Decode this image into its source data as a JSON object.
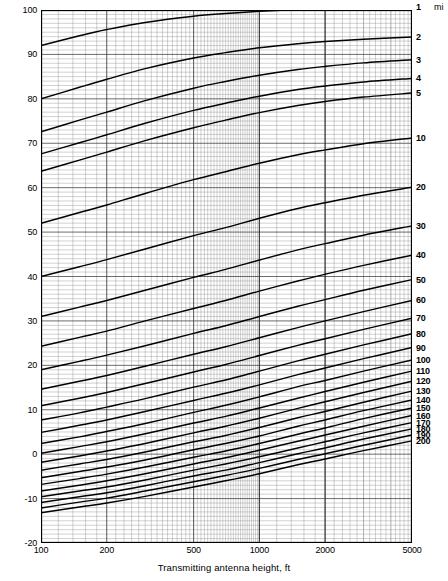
{
  "axes": {
    "x_label": "Transmitting antenna height, ft",
    "y_label": "Field strength F, dB above 1 μ V/m for 1 kW radiated power",
    "right_unit": "mi"
  },
  "chart_data": {
    "type": "line",
    "title": "",
    "xlabel": "Transmitting antenna height, ft",
    "ylabel": "Field strength F, dB above 1 μ V/m for 1 kW radiated power",
    "xscale": "log",
    "yscale": "linear",
    "xlim": [
      100,
      5000
    ],
    "ylim": [
      -20,
      100
    ],
    "grid": true,
    "legend": "right-axis-curve-labels",
    "legend_unit": "mi",
    "x_ticks": [
      100,
      200,
      500,
      1000,
      2000,
      5000
    ],
    "x_tick_labels": [
      "100",
      "200",
      "500",
      "1000",
      "2000",
      "5000"
    ],
    "y_ticks": [
      100,
      90,
      80,
      70,
      60,
      50,
      40,
      30,
      20,
      10,
      0,
      -10,
      -20
    ],
    "y_tick_labels": [
      "100",
      "90",
      "80",
      "70",
      "60",
      "50",
      "40",
      "30",
      "20",
      "10",
      "0",
      "-10",
      "-20"
    ],
    "x": [
      100,
      150,
      200,
      300,
      500,
      700,
      1000,
      1500,
      2000,
      3000,
      5000
    ],
    "series": [
      {
        "name": "1",
        "label": "1",
        "values": [
          92.0,
          94.2,
          95.6,
          97.2,
          98.6,
          99.2,
          99.7,
          100.1,
          100.3,
          100.5,
          100.7
        ]
      },
      {
        "name": "2",
        "label": "2",
        "values": [
          80.0,
          82.6,
          84.4,
          86.8,
          89.2,
          90.4,
          91.5,
          92.4,
          92.9,
          93.4,
          93.9
        ]
      },
      {
        "name": "3",
        "label": "3",
        "values": [
          72.6,
          75.2,
          77.0,
          79.6,
          82.4,
          83.9,
          85.3,
          86.6,
          87.3,
          88.1,
          88.8
        ]
      },
      {
        "name": "4",
        "label": "4",
        "values": [
          67.6,
          70.1,
          71.9,
          74.5,
          77.4,
          79.0,
          80.6,
          82.1,
          82.9,
          83.8,
          84.6
        ]
      },
      {
        "name": "5",
        "label": "5",
        "values": [
          63.7,
          66.2,
          68.0,
          70.6,
          73.5,
          75.2,
          76.9,
          78.5,
          79.4,
          80.4,
          81.3
        ]
      },
      {
        "name": "10",
        "label": "10",
        "values": [
          52.0,
          54.4,
          56.1,
          58.7,
          61.8,
          63.6,
          65.5,
          67.4,
          68.5,
          69.9,
          71.2
        ]
      },
      {
        "name": "20",
        "label": "20",
        "values": [
          40.0,
          42.2,
          43.8,
          46.2,
          49.2,
          51.0,
          53.1,
          55.3,
          56.6,
          58.3,
          60.1
        ]
      },
      {
        "name": "30",
        "label": "30",
        "values": [
          31.0,
          33.1,
          34.6,
          36.9,
          39.8,
          41.6,
          43.7,
          46.0,
          47.4,
          49.3,
          51.4
        ]
      },
      {
        "name": "40",
        "label": "40",
        "values": [
          24.3,
          26.3,
          27.7,
          30.0,
          32.8,
          34.6,
          36.7,
          39.0,
          40.5,
          42.5,
          44.8
        ]
      },
      {
        "name": "50",
        "label": "50",
        "values": [
          19.0,
          20.9,
          22.3,
          24.4,
          27.2,
          28.9,
          31.0,
          33.3,
          34.8,
          36.9,
          39.3
        ]
      },
      {
        "name": "60",
        "label": "60",
        "values": [
          14.6,
          16.4,
          17.7,
          19.8,
          22.5,
          24.2,
          26.2,
          28.5,
          30.0,
          32.1,
          34.6
        ]
      },
      {
        "name": "70",
        "label": "70",
        "values": [
          10.9,
          12.6,
          13.9,
          15.9,
          18.5,
          20.2,
          22.2,
          24.5,
          26.0,
          28.1,
          30.6
        ]
      },
      {
        "name": "80",
        "label": "80",
        "values": [
          7.7,
          9.3,
          10.6,
          12.5,
          15.1,
          16.7,
          18.7,
          21.0,
          22.5,
          24.6,
          27.1
        ]
      },
      {
        "name": "90",
        "label": "90",
        "values": [
          4.9,
          6.5,
          7.7,
          9.6,
          12.1,
          13.7,
          15.6,
          17.9,
          19.4,
          21.5,
          24.0
        ]
      },
      {
        "name": "100",
        "label": "100",
        "values": [
          2.4,
          3.9,
          5.1,
          6.9,
          9.4,
          11.0,
          12.9,
          15.2,
          16.6,
          18.7,
          21.2
        ]
      },
      {
        "name": "110",
        "label": "110",
        "values": [
          0.2,
          1.7,
          2.8,
          4.6,
          7.0,
          8.5,
          10.4,
          12.6,
          14.1,
          16.2,
          18.7
        ]
      },
      {
        "name": "120",
        "label": "120",
        "values": [
          -1.8,
          -0.4,
          0.7,
          2.4,
          4.8,
          6.3,
          8.1,
          10.3,
          11.8,
          13.9,
          16.4
        ]
      },
      {
        "name": "130",
        "label": "130",
        "values": [
          -3.6,
          -2.2,
          -1.2,
          0.5,
          2.8,
          4.2,
          6.0,
          8.2,
          9.6,
          11.7,
          14.2
        ]
      },
      {
        "name": "140",
        "label": "140",
        "values": [
          -5.3,
          -3.9,
          -2.9,
          -1.3,
          1.0,
          2.4,
          4.1,
          6.3,
          7.7,
          9.8,
          12.2
        ]
      },
      {
        "name": "150",
        "label": "150",
        "values": [
          -6.8,
          -5.5,
          -4.5,
          -2.9,
          -0.7,
          0.7,
          2.4,
          4.5,
          5.9,
          8.0,
          10.4
        ]
      },
      {
        "name": "160",
        "label": "160",
        "values": [
          -8.3,
          -7.0,
          -6.0,
          -4.4,
          -2.2,
          -0.8,
          0.9,
          2.9,
          4.3,
          6.3,
          8.7
        ]
      },
      {
        "name": "170",
        "label": "170",
        "values": [
          -9.6,
          -8.3,
          -7.4,
          -5.8,
          -3.6,
          -2.2,
          -0.6,
          1.4,
          2.8,
          4.8,
          7.1
        ]
      },
      {
        "name": "180",
        "label": "180",
        "values": [
          -10.9,
          -9.6,
          -8.7,
          -7.1,
          -4.9,
          -3.6,
          -1.9,
          0.1,
          1.4,
          3.4,
          5.7
        ]
      },
      {
        "name": "190",
        "label": "190",
        "values": [
          -12.1,
          -10.8,
          -9.9,
          -8.3,
          -6.2,
          -4.8,
          -3.2,
          -1.2,
          0.1,
          2.0,
          4.3
        ]
      },
      {
        "name": "200",
        "label": "200",
        "values": [
          -13.2,
          -11.9,
          -11.0,
          -9.5,
          -7.4,
          -6.0,
          -4.4,
          -2.4,
          -1.1,
          0.8,
          3.0
        ]
      }
    ]
  }
}
